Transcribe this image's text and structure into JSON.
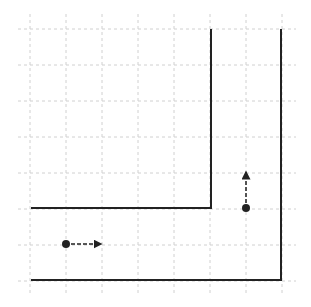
{
  "diagram": {
    "type": "grid-path-diagram",
    "grid": {
      "spacing": 36,
      "origin": [
        30,
        29
      ],
      "columns": 8,
      "rows": 8,
      "extent": {
        "x0": 18,
        "y0": 14,
        "x1": 296,
        "y1": 296
      },
      "color": "#d0d0d0"
    },
    "walls": [
      {
        "name": "inner-wall",
        "points": [
          [
            211,
            29
          ],
          [
            211,
            208
          ],
          [
            31,
            208
          ]
        ]
      },
      {
        "name": "outer-wall",
        "points": [
          [
            281,
            29
          ],
          [
            281,
            280
          ],
          [
            31,
            280
          ]
        ]
      }
    ],
    "agents": [
      {
        "name": "agent-left",
        "position": [
          66,
          244
        ],
        "arrow_to": [
          101,
          244
        ],
        "direction": "right"
      },
      {
        "name": "agent-right",
        "position": [
          246,
          208
        ],
        "arrow_to": [
          246,
          172
        ],
        "direction": "up"
      }
    ],
    "colors": {
      "wall": "#222222",
      "agent": "#222222",
      "background": "#ffffff"
    }
  }
}
